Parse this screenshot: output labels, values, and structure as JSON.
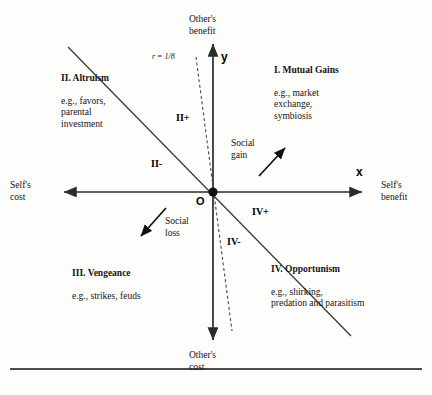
{
  "figure": {
    "axes": {
      "x_letter": "x",
      "y_letter": "y",
      "origin_letter": "O",
      "top_label": "Other's\nbenefit",
      "bottom_label": "Other's\ncost",
      "left_label": "Self's\ncost",
      "right_label": "Self's\nbenefit"
    },
    "relatedness_label": "r = 1/8",
    "quadrants": [
      {
        "id": "I",
        "title": "I. Mutual Gains",
        "body": "e.g., market\nexchange,\nsymbiosis"
      },
      {
        "id": "II",
        "title": "II. Altruism",
        "body": "e.g., favors,\nparental\ninvestment"
      },
      {
        "id": "III",
        "title": "III. Vengeance",
        "body": "e.g., strikes, feuds"
      },
      {
        "id": "IV",
        "title": "IV. Opportunism",
        "body": "e.g., shirking,\npredation and parasitism"
      }
    ],
    "sub_regions": [
      {
        "id": "II+",
        "label": "II+"
      },
      {
        "id": "II-",
        "label": "II-"
      },
      {
        "id": "IV+",
        "label": "IV+"
      },
      {
        "id": "IV-",
        "label": "IV-"
      }
    ],
    "flows": [
      {
        "id": "social-gain",
        "label": "Social\ngain",
        "direction": "up-right"
      },
      {
        "id": "social-loss",
        "label": "Social\nloss",
        "direction": "down-left"
      }
    ],
    "colors": {
      "axis": "#2b2b2b",
      "solid_line": "#3a3a3a",
      "dashed_line": "#4a4a4a",
      "text": "#141414",
      "background": "#fdfdfc",
      "rule": "#111111"
    }
  }
}
